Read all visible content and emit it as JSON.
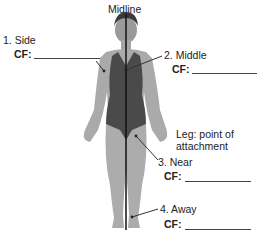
{
  "title": "Midline",
  "labels": [
    {
      "id": "side",
      "text": "1. Side",
      "cf_label": "CF:",
      "cf_value": ""
    },
    {
      "id": "middle",
      "text": "2. Middle",
      "cf_label": "CF:",
      "cf_value": ""
    },
    {
      "id": "near",
      "text": "3. Near",
      "cf_label": "CF:",
      "cf_value": ""
    },
    {
      "id": "away",
      "text": "4. Away",
      "cf_label": "CF:",
      "cf_value": ""
    }
  ],
  "annotation": {
    "line1": "Leg: point of",
    "line2": "attachment"
  },
  "colors": {
    "skin": "#a9a9a9",
    "swimsuit": "#4a4a4a",
    "midline": "#111111",
    "leader": "#333333"
  }
}
